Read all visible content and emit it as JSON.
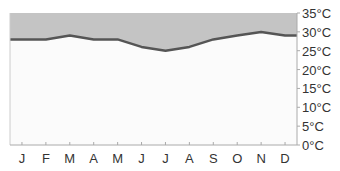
{
  "chart_data": {
    "type": "area",
    "title": "",
    "xlabel": "",
    "ylabel": "",
    "categories": [
      "J",
      "F",
      "M",
      "A",
      "M",
      "J",
      "J",
      "A",
      "S",
      "O",
      "N",
      "D"
    ],
    "series": [
      {
        "name": "Temperature",
        "values": [
          28,
          28,
          29,
          28,
          28,
          26,
          25,
          26,
          28,
          29,
          30,
          29
        ]
      }
    ],
    "ylim": [
      0,
      35
    ],
    "yticks": [
      0,
      5,
      10,
      15,
      20,
      25,
      30,
      35
    ],
    "ytick_labels": [
      "0°C",
      "5°C",
      "10°C",
      "15°C",
      "20°C",
      "25°C",
      "30°C",
      "35°C"
    ],
    "y_axis_position": "right",
    "grid": false,
    "legend": "none",
    "colors": {
      "above_line_fill": "#c4c4c4",
      "below_line_fill": "#fbfbfb",
      "line": "#555555",
      "axis": "#aaaaaa",
      "text": "#333333"
    }
  }
}
